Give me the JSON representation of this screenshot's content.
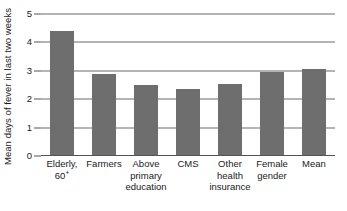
{
  "chart_data": {
    "type": "bar",
    "title": "",
    "xlabel": "",
    "ylabel": "Mean days of fever in last two weeks",
    "ylim": [
      0,
      5
    ],
    "yticks": [
      "0",
      "1",
      "2",
      "3",
      "4",
      "5"
    ],
    "grid": true,
    "legend": "none",
    "bar_color": "#6e6e6e",
    "categories": [
      "Elderly, 60+",
      "Farmers",
      "Above primary education",
      "CMS",
      "Other health insurance",
      "Female gender",
      "Mean"
    ],
    "category_lines": [
      [
        "Elderly,",
        "60+"
      ],
      [
        "Farmers"
      ],
      [
        "Above",
        "primary",
        "education"
      ],
      [
        "CMS"
      ],
      [
        "Other",
        "health",
        "insurance"
      ],
      [
        "Female",
        "gender"
      ],
      [
        "Mean"
      ]
    ],
    "values": [
      4.4,
      2.9,
      2.5,
      2.35,
      2.55,
      2.95,
      3.05
    ]
  },
  "colors": {
    "bar": "#6e6e6e",
    "gridline": "#6a6a6a",
    "axis": "#555555",
    "text": "#1a1a1a",
    "background": "#ffffff"
  }
}
